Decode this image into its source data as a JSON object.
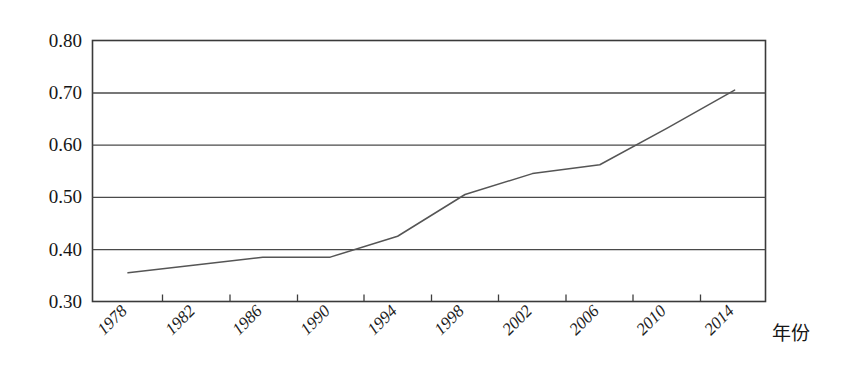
{
  "chart_data": {
    "type": "line",
    "title": "",
    "xlabel": "年份",
    "ylabel": "",
    "x": [
      1978,
      1982,
      1986,
      1990,
      1994,
      1998,
      2002,
      2006,
      2010,
      2014
    ],
    "values": [
      0.355,
      0.37,
      0.385,
      0.385,
      0.425,
      0.505,
      0.545,
      0.562,
      0.632,
      0.705
    ],
    "series": [
      {
        "name": "",
        "values": [
          0.355,
          0.37,
          0.385,
          0.385,
          0.425,
          0.505,
          0.545,
          0.562,
          0.632,
          0.705
        ]
      }
    ],
    "xtick_labels": [
      "1978",
      "1982",
      "1986",
      "1990",
      "1994",
      "1998",
      "2002",
      "2006",
      "2010",
      "2014"
    ],
    "ytick_labels": [
      "0.30",
      "0.40",
      "0.50",
      "0.60",
      "0.70",
      "0.80"
    ],
    "ytick_values": [
      0.3,
      0.4,
      0.5,
      0.6,
      0.7,
      0.8
    ],
    "ylim": [
      0.3,
      0.8
    ],
    "xlim": [
      1978,
      2014
    ],
    "grid": "horizontal",
    "legend": "none",
    "line_color": "#555555",
    "frame_color": "#3a3a3a"
  },
  "axes": {
    "y_labels": {
      "t0": "0.80",
      "t1": "0.70",
      "t2": "0.60",
      "t3": "0.50",
      "t4": "0.40",
      "t5": "0.30"
    },
    "x_labels": {
      "t0": "1978",
      "t1": "1982",
      "t2": "1986",
      "t3": "1990",
      "t4": "1994",
      "t5": "1998",
      "t6": "2002",
      "t7": "2006",
      "t8": "2010",
      "t9": "2014"
    },
    "x_axis_title": "年份"
  }
}
